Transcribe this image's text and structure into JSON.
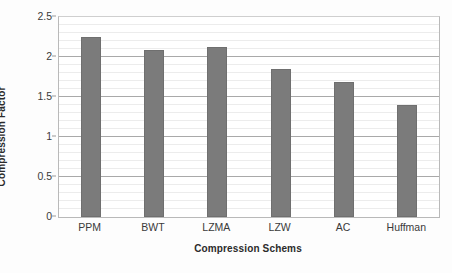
{
  "chart_data": {
    "type": "bar",
    "title": "",
    "categories": [
      "PPM",
      "BWT",
      "LZMA",
      "LZW",
      "AC",
      "Huffman"
    ],
    "values": [
      2.25,
      2.09,
      2.13,
      1.85,
      1.69,
      1.4
    ],
    "xlabel": "Compression Schems",
    "ylabel": "Compression Factor",
    "ylim": [
      0,
      2.5
    ],
    "ytick_labels": [
      "0",
      "0.5",
      "1",
      "1.5",
      "2",
      "2.5"
    ],
    "ytick_values": [
      0,
      0.5,
      1,
      1.5,
      2,
      2.5
    ],
    "ytick_step": 0.5,
    "minor_gridline_step": 0.1,
    "grid": true,
    "legend": "none",
    "bar_color": "#7b7b7b",
    "major_gridline_color": "#a9a9a9",
    "minor_gridline_color": "#ececec",
    "plot_border_color": "#b9b9b9",
    "background_color": "#ffffff"
  }
}
